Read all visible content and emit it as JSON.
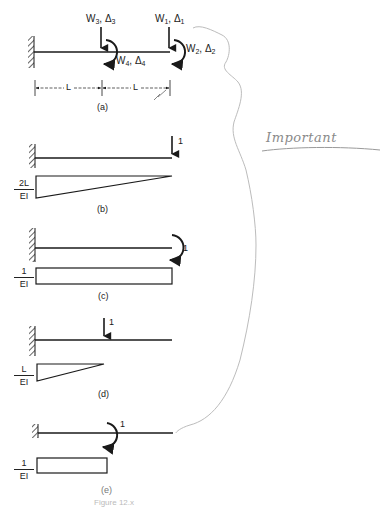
{
  "figure": {
    "caption_partial": "Figure 12.x",
    "panels": [
      {
        "id": "a",
        "caption": "(a)",
        "labels": {
          "w3": "W",
          "w3_sub": "3",
          "d3": "Δ",
          "d3_sub": "3",
          "w1": "W",
          "w1_sub": "1",
          "d1": "Δ",
          "d1_sub": "1",
          "w4": "W",
          "w4_sub": "4",
          "d4": "Δ",
          "d4_sub": "4",
          "w2": "W",
          "w2_sub": "2",
          "d2": "Δ",
          "d2_sub": "2",
          "span1": "L",
          "span2": "L"
        }
      },
      {
        "id": "b",
        "caption": "(b)",
        "load_label": "1",
        "moment_num": "2L",
        "moment_den": "EI"
      },
      {
        "id": "c",
        "caption": "(c)",
        "load_label": "1",
        "moment_num": "1",
        "moment_den": "EI"
      },
      {
        "id": "d",
        "caption": "(d)",
        "load_label": "1",
        "moment_num": "L",
        "moment_den": "EI"
      },
      {
        "id": "e",
        "caption": "(e)",
        "load_label": "1",
        "moment_num": "1",
        "moment_den": "EI"
      }
    ]
  },
  "annotations": {
    "handwritten_note": "Important",
    "pencil_color": "#b8b8b8",
    "ink_color": "#1a1a1a"
  }
}
